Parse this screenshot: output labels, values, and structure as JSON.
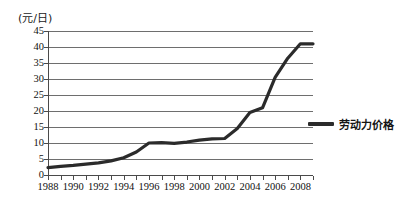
{
  "chart_data": {
    "type": "line",
    "title": "",
    "ylabel": "(元/日)",
    "xlabel": "",
    "ylim": [
      0,
      45
    ],
    "xlim": [
      1988,
      2009
    ],
    "grid": true,
    "legend_position": "right",
    "y_ticks": [
      "45",
      "40",
      "35",
      "30",
      "25",
      "20",
      "15",
      "10",
      "5",
      "0"
    ],
    "y_tick_values": [
      45,
      40,
      35,
      30,
      25,
      20,
      15,
      10,
      5,
      0
    ],
    "x_tick_labels": [
      "1988",
      "1990",
      "1992",
      "1994",
      "1996",
      "1998",
      "2000",
      "2002",
      "2004",
      "2006",
      "2008"
    ],
    "x_tick_values": [
      1988,
      1990,
      1992,
      1994,
      1996,
      1998,
      2000,
      2002,
      2004,
      2006,
      2008
    ],
    "x_minor_ticks": [
      1988,
      1989,
      1990,
      1991,
      1992,
      1993,
      1994,
      1995,
      1996,
      1997,
      1998,
      1999,
      2000,
      2001,
      2002,
      2003,
      2004,
      2005,
      2006,
      2007,
      2008,
      2009
    ],
    "series": [
      {
        "name": "劳动力价格",
        "color": "#2b2b2b",
        "x": [
          1988,
          1989,
          1990,
          1991,
          1992,
          1993,
          1994,
          1995,
          1996,
          1997,
          1998,
          1999,
          2000,
          2001,
          2002,
          2003,
          2004,
          2005,
          2006,
          2007,
          2008,
          2009
        ],
        "values": [
          2.3,
          2.7,
          3.0,
          3.4,
          3.8,
          4.4,
          5.4,
          7.2,
          10.0,
          10.1,
          9.9,
          10.3,
          10.9,
          11.3,
          11.4,
          14.5,
          19.5,
          21.0,
          30.5,
          36.5,
          41.0,
          41.0
        ]
      }
    ]
  },
  "legend": {
    "items": [
      {
        "label": "劳动力价格"
      }
    ]
  }
}
